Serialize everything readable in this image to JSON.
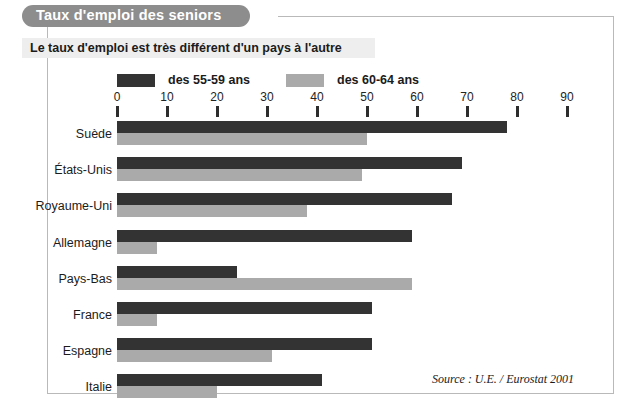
{
  "header": {
    "title": "Taux d'emploi des seniors",
    "subtitle": "Le taux d'emploi est très différent d'un pays à l'autre"
  },
  "source_note": "Source : U.E. / Eurostat 2001",
  "colors": {
    "series_dark": "#333333",
    "series_light": "#aaaaaa",
    "title_pill": "#8d8d8d",
    "subtitle_band": "#eeeeee",
    "frame": "#b9b9b9",
    "text": "#1b1b1b"
  },
  "chart_data": {
    "type": "bar",
    "orientation": "horizontal",
    "title": "Taux d'emploi des seniors",
    "subtitle": "Le taux d'emploi est très différent d'un pays à l'autre",
    "xlabel": "",
    "ylabel": "",
    "xlim": [
      0,
      90
    ],
    "xticks": [
      0,
      10,
      20,
      30,
      40,
      50,
      60,
      70,
      80,
      90
    ],
    "xtick_labels": [
      "0",
      "10",
      "20",
      "30",
      "40",
      "50",
      "60",
      "70",
      "80",
      "90"
    ],
    "grid": false,
    "legend_position": "top",
    "categories": [
      "Suède",
      "États-Unis",
      "Royaume-Uni",
      "Allemagne",
      "Pays-Bas",
      "France",
      "Espagne",
      "Italie"
    ],
    "series": [
      {
        "name": "des 55-59 ans",
        "color": "#333333",
        "values": [
          78,
          69,
          67,
          59,
          24,
          51,
          51,
          41
        ]
      },
      {
        "name": "des 60-64 ans",
        "color": "#aaaaaa",
        "values": [
          50,
          49,
          38,
          8,
          59,
          8,
          31,
          20
        ]
      }
    ],
    "annotations": [
      "Source : U.E. / Eurostat 2001"
    ]
  }
}
